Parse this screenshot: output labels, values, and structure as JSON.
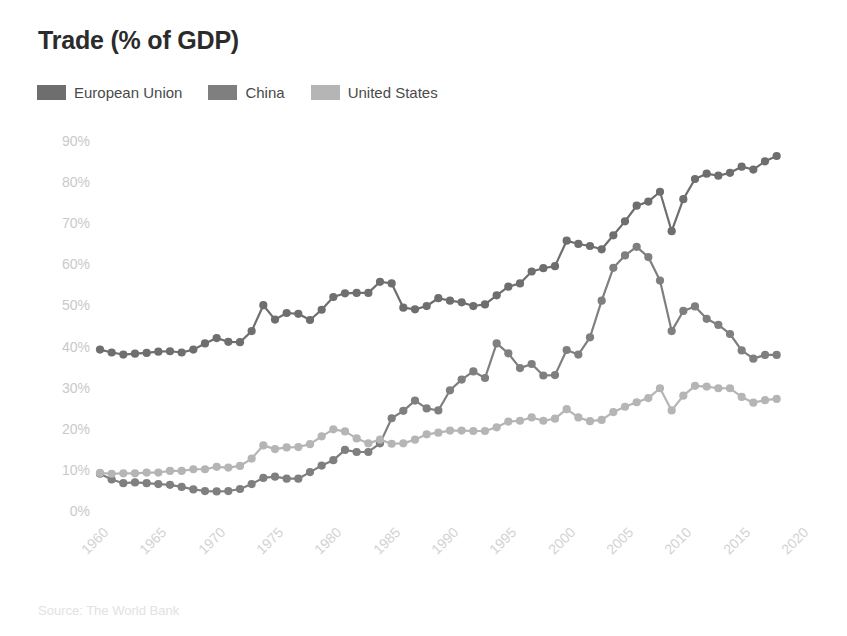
{
  "title": "Trade (% of GDP)",
  "source": "Source: The World Bank",
  "legend": [
    {
      "label": "European Union",
      "color": "#6e6e6e",
      "icon": "legend-swatch-icon"
    },
    {
      "label": "China",
      "color": "#7f7f7f",
      "icon": "legend-swatch-icon"
    },
    {
      "label": "United States",
      "color": "#b5b5b5",
      "icon": "legend-swatch-icon"
    }
  ],
  "axis": {
    "y_ticks": [
      "0%",
      "10%",
      "20%",
      "30%",
      "40%",
      "50%",
      "60%",
      "70%",
      "80%",
      "90%"
    ],
    "x_ticks": [
      "1960",
      "1965",
      "1970",
      "1975",
      "1980",
      "1985",
      "1990",
      "1995",
      "2000",
      "2005",
      "2010",
      "2015",
      "2020"
    ]
  },
  "chart_data": {
    "type": "line",
    "title": "Trade (% of GDP)",
    "xlabel": "",
    "ylabel": "",
    "ylim": [
      0,
      90
    ],
    "xlim": [
      1960,
      2020
    ],
    "grid": false,
    "legend_position": "top-left",
    "ytick_labels": [
      "0%",
      "10%",
      "20%",
      "30%",
      "40%",
      "50%",
      "60%",
      "70%",
      "80%",
      "90%"
    ],
    "xtick_labels": [
      "1960",
      "1965",
      "1970",
      "1975",
      "1980",
      "1985",
      "1990",
      "1995",
      "2000",
      "2005",
      "2010",
      "2015",
      "2020"
    ],
    "x": [
      1960,
      1961,
      1962,
      1963,
      1964,
      1965,
      1966,
      1967,
      1968,
      1969,
      1970,
      1971,
      1972,
      1973,
      1974,
      1975,
      1976,
      1977,
      1978,
      1979,
      1980,
      1981,
      1982,
      1983,
      1984,
      1985,
      1986,
      1987,
      1988,
      1989,
      1990,
      1991,
      1992,
      1993,
      1994,
      1995,
      1996,
      1997,
      1998,
      1999,
      2000,
      2001,
      2002,
      2003,
      2004,
      2005,
      2006,
      2007,
      2008,
      2009,
      2010,
      2011,
      2012,
      2013,
      2014,
      2015,
      2016,
      2017,
      2018
    ],
    "series": [
      {
        "name": "European Union",
        "color": "#6e6e6e",
        "values": [
          39.5,
          38.8,
          38.3,
          38.5,
          38.7,
          39.0,
          39.1,
          38.8,
          39.5,
          41.0,
          42.3,
          41.4,
          41.3,
          44.0,
          50.3,
          46.8,
          48.4,
          48.2,
          46.7,
          49.2,
          52.3,
          53.2,
          53.3,
          53.3,
          56.0,
          55.6,
          49.7,
          49.3,
          50.1,
          52.0,
          51.4,
          51.0,
          50.1,
          50.5,
          52.7,
          54.8,
          55.6,
          58.5,
          59.3,
          59.8,
          66.0,
          65.2,
          64.7,
          63.9,
          67.3,
          70.7,
          74.5,
          75.5,
          77.9,
          68.3,
          76.1,
          81.0,
          82.3,
          81.8,
          82.5,
          84.0,
          83.3,
          85.3,
          86.6
        ]
      },
      {
        "name": "China",
        "color": "#7f7f7f",
        "values": [
          9.3,
          7.9,
          7.0,
          7.2,
          7.0,
          6.8,
          6.6,
          6.1,
          5.5,
          5.1,
          5.0,
          5.1,
          5.6,
          6.8,
          8.3,
          8.6,
          8.1,
          8.1,
          9.7,
          11.3,
          12.6,
          15.1,
          14.6,
          14.6,
          16.7,
          22.8,
          24.6,
          27.1,
          25.2,
          24.7,
          29.6,
          32.2,
          34.2,
          32.6,
          41.0,
          38.6,
          35.0,
          36.0,
          33.2,
          33.3,
          39.4,
          38.3,
          42.5,
          51.4,
          59.4,
          62.4,
          64.5,
          62.0,
          56.3,
          44.0,
          48.9,
          50.0,
          47.0,
          45.5,
          43.3,
          39.3,
          37.3,
          38.2,
          38.2
        ]
      },
      {
        "name": "United States",
        "color": "#b5b5b5",
        "values": [
          9.5,
          9.3,
          9.4,
          9.4,
          9.6,
          9.6,
          10.0,
          10.0,
          10.4,
          10.4,
          11.0,
          10.8,
          11.2,
          13.0,
          16.2,
          15.3,
          15.7,
          15.8,
          16.5,
          18.4,
          20.1,
          19.6,
          17.9,
          16.7,
          17.6,
          16.6,
          16.7,
          17.6,
          18.9,
          19.3,
          19.8,
          19.8,
          19.7,
          19.7,
          20.6,
          22.0,
          22.2,
          23.0,
          22.2,
          22.7,
          25.0,
          23.0,
          22.1,
          22.4,
          24.3,
          25.6,
          26.7,
          27.7,
          30.1,
          24.7,
          28.3,
          30.7,
          30.5,
          30.1,
          30.1,
          28.0,
          26.6,
          27.2,
          27.5
        ]
      }
    ]
  },
  "plot_geometry": {
    "left_px": 100,
    "right_px": 800,
    "top_px": 142,
    "bottom_px": 512
  }
}
